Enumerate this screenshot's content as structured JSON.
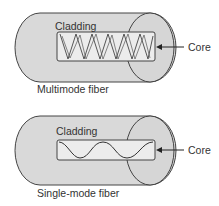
{
  "diagrams": [
    {
      "caption": "Multimode fiber",
      "cladding_label": "Cladding",
      "core_label": "Core"
    },
    {
      "caption": "Single-mode fiber",
      "cladding_label": "Cladding",
      "core_label": "Core"
    }
  ],
  "colors": {
    "cladding_fill": "#d9d9d9",
    "core_fill": "#ececec",
    "stroke": "#444444",
    "text": "#333333"
  }
}
